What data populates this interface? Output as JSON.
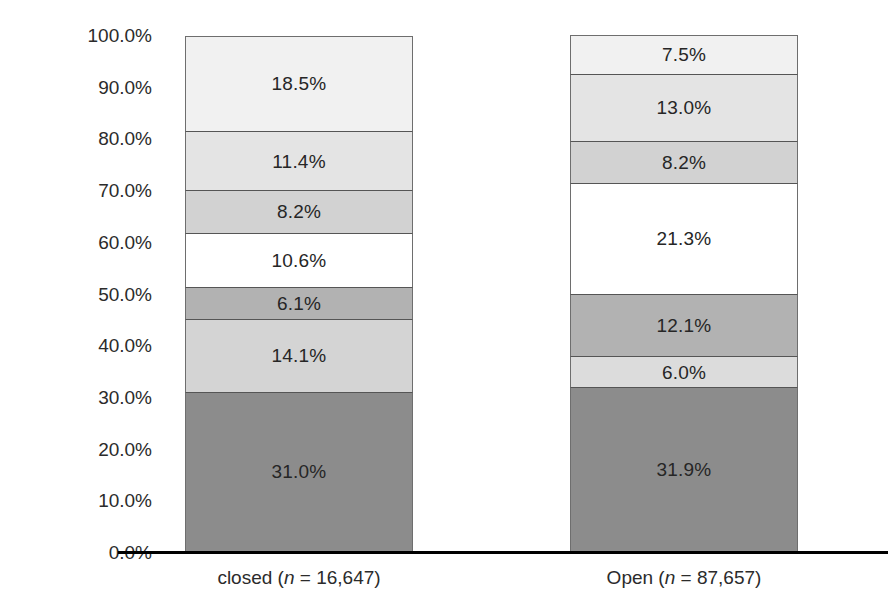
{
  "chart_data": {
    "type": "bar",
    "subtype": "100% stacked column",
    "title": "",
    "subtitle": "",
    "xlabel": "",
    "ylabel": "",
    "ylim": [
      0,
      100
    ],
    "y_tick_labels": [
      "0.0%",
      "10.0%",
      "20.0%",
      "30.0%",
      "40.0%",
      "50.0%",
      "60.0%",
      "70.0%",
      "80.0%",
      "90.0%",
      "100.0%"
    ],
    "y_tick_values": [
      0,
      10,
      20,
      30,
      40,
      50,
      60,
      70,
      80,
      90,
      100
    ],
    "grid": false,
    "legend": "none",
    "categories": [
      "closed",
      "Open"
    ],
    "category_labels": [
      {
        "name": "closed",
        "n_prefix": "closed (",
        "n_var": "n",
        "n_suffix": " = 16,647)",
        "n": "16,647"
      },
      {
        "name": "Open",
        "n_prefix": "Open (",
        "n_var": "n",
        "n_suffix": " = 87,657)",
        "n": "87,657"
      }
    ],
    "stack_order": "bottom-to-top",
    "series": [
      {
        "name": "segment-1",
        "values": [
          31.0,
          31.9
        ],
        "labels": [
          "31.0%",
          "31.9%"
        ],
        "color": "#8c8c8c"
      },
      {
        "name": "segment-2",
        "values": [
          14.1,
          6.0
        ],
        "labels": [
          "14.1%",
          "6.0%"
        ],
        "color": "#d4d4d4"
      },
      {
        "name": "segment-3",
        "values": [
          6.1,
          12.1
        ],
        "labels": [
          "6.1%",
          "12.1%"
        ],
        "color": "#b2b2b2"
      },
      {
        "name": "segment-4",
        "values": [
          10.6,
          21.3
        ],
        "labels": [
          "10.6%",
          "21.3%"
        ],
        "color": "#ffffff"
      },
      {
        "name": "segment-5",
        "values": [
          8.2,
          8.2
        ],
        "labels": [
          "8.2%",
          "8.2%"
        ],
        "color": "#d2d2d2"
      },
      {
        "name": "segment-6",
        "values": [
          11.4,
          13.0
        ],
        "labels": [
          "11.4%",
          "13.0%"
        ],
        "color": "#e4e4e4"
      },
      {
        "name": "segment-7",
        "values": [
          18.5,
          7.5
        ],
        "labels": [
          "18.5%",
          "7.5%"
        ],
        "color": "#f1f1f1"
      }
    ]
  },
  "axis": {
    "ticks": [
      {
        "label": "100.0%",
        "value": 100
      },
      {
        "label": "90.0%",
        "value": 90
      },
      {
        "label": "80.0%",
        "value": 80
      },
      {
        "label": "70.0%",
        "value": 70
      },
      {
        "label": "60.0%",
        "value": 60
      },
      {
        "label": "50.0%",
        "value": 50
      },
      {
        "label": "40.0%",
        "value": 40
      },
      {
        "label": "30.0%",
        "value": 30
      },
      {
        "label": "20.0%",
        "value": 20
      },
      {
        "label": "10.0%",
        "value": 10
      },
      {
        "label": "0.0%",
        "value": 0
      }
    ]
  },
  "bars": [
    {
      "key": "closed",
      "label_prefix": "closed (",
      "label_var": "n",
      "label_suffix": " = 16,647)",
      "segments": [
        {
          "label": "31.0%",
          "value": 31.0,
          "color": "#8c8c8c"
        },
        {
          "label": "14.1%",
          "value": 14.1,
          "color": "#d4d4d4"
        },
        {
          "label": "6.1%",
          "value": 6.1,
          "color": "#b2b2b2"
        },
        {
          "label": "10.6%",
          "value": 10.6,
          "color": "#ffffff"
        },
        {
          "label": "8.2%",
          "value": 8.2,
          "color": "#d2d2d2"
        },
        {
          "label": "11.4%",
          "value": 11.4,
          "color": "#e4e4e4"
        },
        {
          "label": "18.5%",
          "value": 18.5,
          "color": "#f1f1f1"
        }
      ]
    },
    {
      "key": "open",
      "label_prefix": "Open (",
      "label_var": "n",
      "label_suffix": " = 87,657)",
      "segments": [
        {
          "label": "31.9%",
          "value": 31.9,
          "color": "#8c8c8c"
        },
        {
          "label": "6.0%",
          "value": 6.0,
          "color": "#dcdcdc"
        },
        {
          "label": "12.1%",
          "value": 12.1,
          "color": "#b2b2b2"
        },
        {
          "label": "21.3%",
          "value": 21.3,
          "color": "#ffffff"
        },
        {
          "label": "8.2%",
          "value": 8.2,
          "color": "#d2d2d2"
        },
        {
          "label": "13.0%",
          "value": 13.0,
          "color": "#e4e4e4"
        },
        {
          "label": "7.5%",
          "value": 7.5,
          "color": "#f1f1f1"
        }
      ]
    }
  ]
}
